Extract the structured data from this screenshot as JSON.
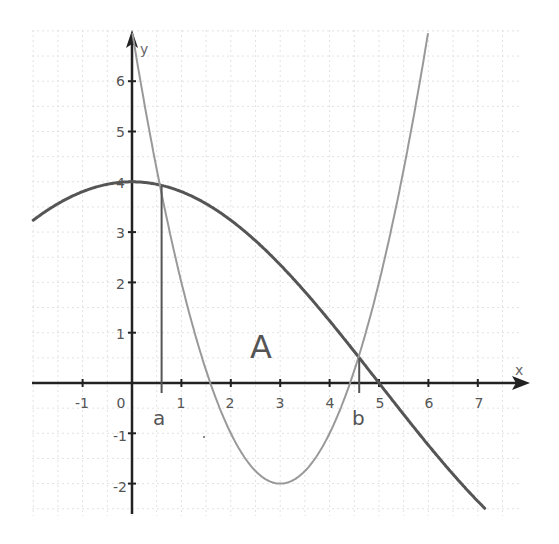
{
  "chart_data": {
    "type": "line",
    "title": "",
    "xlabel": "x",
    "ylabel": "y",
    "xlim": [
      -2,
      8
    ],
    "ylim": [
      -2.6,
      7
    ],
    "grid": true,
    "x_ticks": [
      -1,
      0,
      1,
      2,
      3,
      4,
      5,
      6,
      7
    ],
    "x_tick_labels": [
      "-1",
      "0",
      "1",
      "2",
      "3",
      "4",
      "5",
      "6",
      "7"
    ],
    "y_ticks": [
      -2,
      -1,
      1,
      2,
      3,
      4,
      5,
      6
    ],
    "y_tick_labels": [
      "-2",
      "-1",
      "1",
      "2",
      "3",
      "4",
      "5",
      "6"
    ],
    "series": [
      {
        "name": "f(x) ≈ 4cos(πx/10)",
        "color": "#555555",
        "x": [
          -2,
          -1,
          0,
          0.6,
          1,
          2,
          3,
          4,
          4.6,
          5,
          6,
          7,
          7.1
        ],
        "y": [
          3.24,
          3.8,
          4,
          3.93,
          3.8,
          3.24,
          2.35,
          1.24,
          0.5,
          0,
          -1.24,
          -2.35,
          -2.45
        ]
      },
      {
        "name": "g(x) = (x-3)² - 2",
        "color": "#999999",
        "x": [
          0,
          0.6,
          1,
          1.59,
          2,
          3,
          4,
          4.41,
          4.6,
          5,
          6,
          6.1
        ],
        "y": [
          7,
          3.76,
          2,
          0,
          -1,
          -2,
          -1,
          0,
          0.56,
          2,
          7,
          7.6
        ]
      }
    ],
    "annotations": [
      {
        "text": "a",
        "x": 0.6,
        "note": "left intersection, vertical line from x-axis to curves"
      },
      {
        "text": "b",
        "x": 4.6,
        "note": "right intersection, vertical line from x-axis to curves"
      },
      {
        "text": "A",
        "x": 2.7,
        "y": 0.7,
        "note": "enclosed area label"
      }
    ]
  },
  "labels": {
    "x_axis": "x",
    "y_axis": "y",
    "point_a": "a",
    "point_b": "b",
    "region": "A",
    "x_ticks": [
      "-1",
      "0",
      "1",
      "2",
      "3",
      "4",
      "5",
      "6",
      "7"
    ],
    "y_ticks": [
      "6",
      "5",
      "4",
      "3",
      "2",
      "1",
      "-1",
      "-2"
    ]
  }
}
